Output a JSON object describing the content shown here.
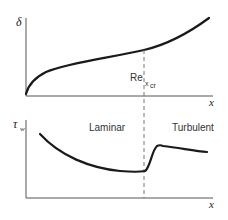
{
  "top_plot": {
    "y_label": "δ",
    "x_label": "x",
    "critical_label_main": "Re",
    "critical_label_sub": "x",
    "critical_label_subsub": "cr",
    "description": "Boundary layer thickness vs. distance"
  },
  "bottom_plot": {
    "y_label_main": "τ",
    "y_label_sub": "w",
    "x_label": "x",
    "region_left": "Laminar",
    "region_right": "Turbulent",
    "description": "Wall shear stress vs. distance"
  },
  "colors": {
    "curve": "#1a1a1a",
    "axis": "#555555",
    "dashed": "#777777"
  }
}
